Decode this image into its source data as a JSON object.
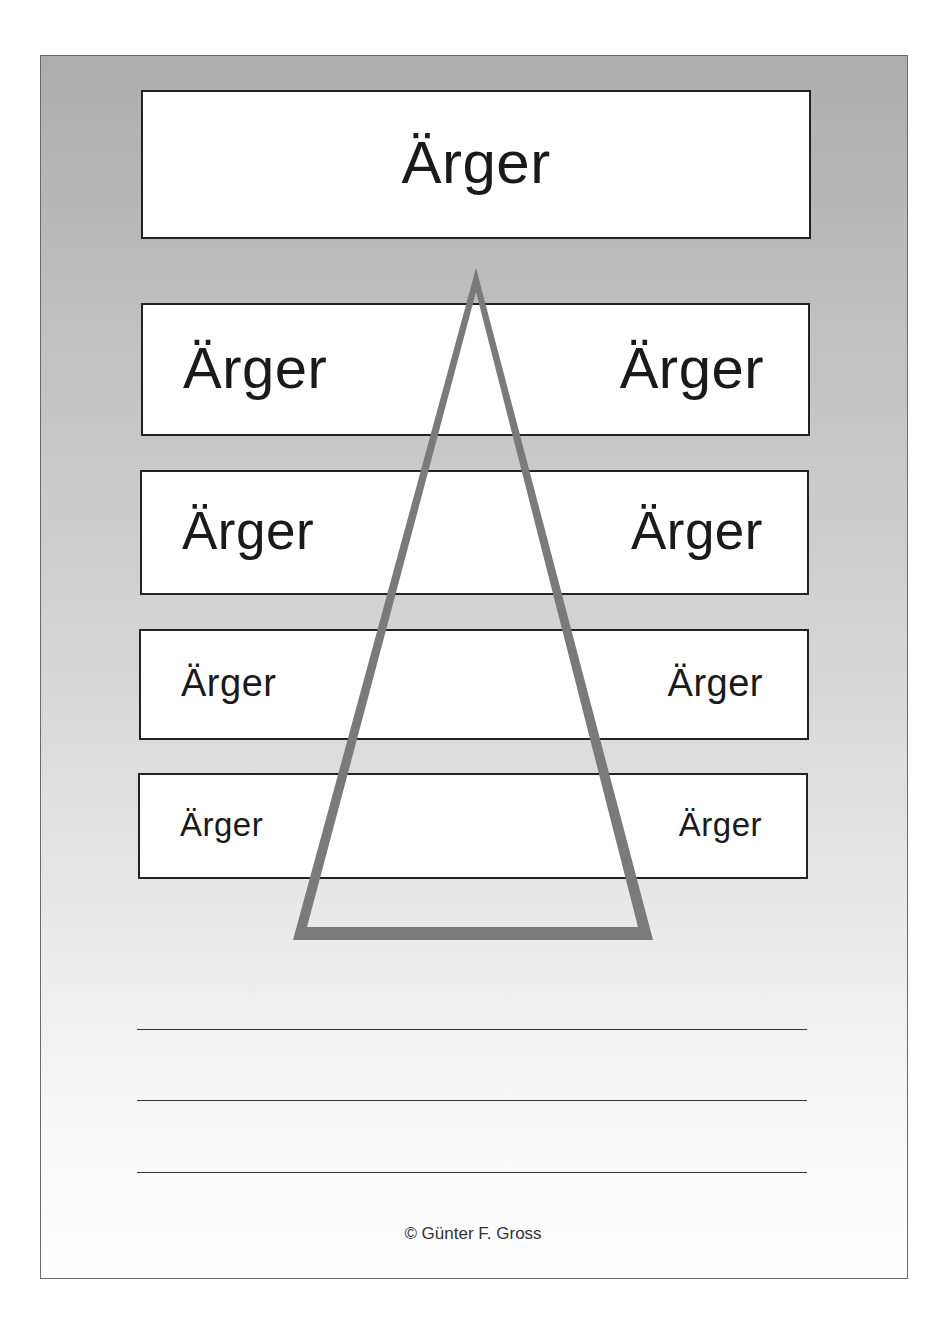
{
  "worksheet": {
    "top_box": {
      "word": "Ärger"
    },
    "rows": [
      {
        "left": "Ärger",
        "right": "Ärger"
      },
      {
        "left": "Ärger",
        "right": "Ärger"
      },
      {
        "left": "Ärger",
        "right": "Ärger"
      },
      {
        "left": "Ärger",
        "right": "Ärger"
      }
    ],
    "triangle": {
      "color": "#7a7a7a"
    },
    "writing_lines": 3,
    "copyright": "© Günter F. Gross"
  },
  "colors": {
    "frame_gradient_top": "#adadad",
    "frame_gradient_bottom": "#ffffff",
    "box_border": "#222222",
    "text": "#1a1a1a"
  }
}
